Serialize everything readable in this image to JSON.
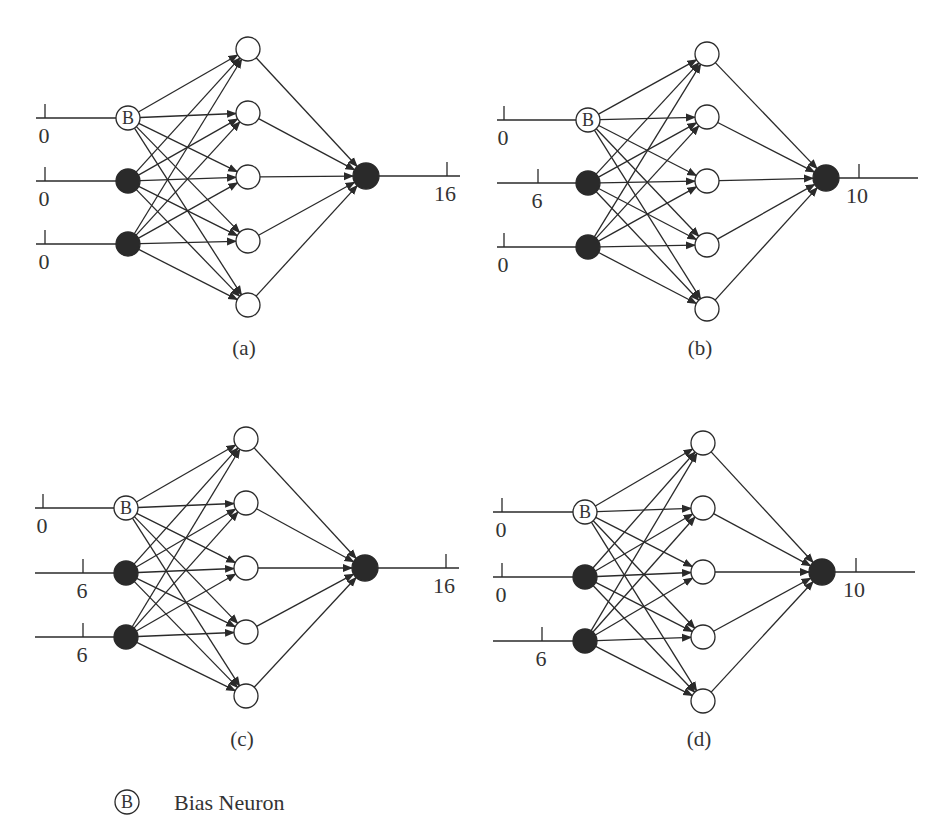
{
  "figure": {
    "colors": {
      "ink": "#2a2a2a",
      "text": "#333333",
      "background": "#ffffff"
    },
    "bias_symbol": "B",
    "legend": {
      "symbol": "B",
      "label": "Bias Neuron",
      "cx": 127,
      "cy": 802,
      "r": 12,
      "text_x": 174,
      "text_y": 810
    },
    "panels": [
      {
        "id": "a",
        "caption": "(a)",
        "caption_x": 244,
        "caption_y": 355,
        "input_line_start": 36,
        "inputs": [
          {
            "type": "bias",
            "value": "0",
            "cx": 128,
            "cy": 118,
            "tick_x": 45
          },
          {
            "type": "neuron",
            "value": "0",
            "cx": 128,
            "cy": 181,
            "tick_x": 45
          },
          {
            "type": "neuron",
            "value": "0",
            "cx": 128,
            "cy": 244,
            "tick_x": 45
          }
        ],
        "hidden": {
          "cx": 248,
          "cy": [
            49,
            113,
            177,
            241,
            305
          ]
        },
        "output": {
          "value": "16",
          "cx": 366,
          "cy": 176,
          "tick_x": 447,
          "line_end": 460
        }
      },
      {
        "id": "b",
        "caption": "(b)",
        "caption_x": 700,
        "caption_y": 355,
        "input_line_start": 497,
        "inputs": [
          {
            "type": "bias",
            "value": "0",
            "cx": 588,
            "cy": 120,
            "tick_x": 504
          },
          {
            "type": "neuron",
            "value": "6",
            "cx": 588,
            "cy": 183,
            "tick_x": 538
          },
          {
            "type": "neuron",
            "value": "0",
            "cx": 588,
            "cy": 247,
            "tick_x": 504
          }
        ],
        "hidden": {
          "cx": 707,
          "cy": [
            54,
            117,
            181,
            245,
            309
          ]
        },
        "output": {
          "value": "10",
          "cx": 826,
          "cy": 178,
          "tick_x": 859,
          "line_end": 918
        }
      },
      {
        "id": "c",
        "caption": "(c)",
        "caption_x": 242,
        "caption_y": 746,
        "input_line_start": 35,
        "inputs": [
          {
            "type": "bias",
            "value": "0",
            "cx": 126,
            "cy": 508,
            "tick_x": 43
          },
          {
            "type": "neuron",
            "value": "6",
            "cx": 126,
            "cy": 573,
            "tick_x": 83
          },
          {
            "type": "neuron",
            "value": "6",
            "cx": 126,
            "cy": 637,
            "tick_x": 83
          }
        ],
        "hidden": {
          "cx": 246,
          "cy": [
            439,
            503,
            568,
            632,
            696
          ]
        },
        "output": {
          "value": "16",
          "cx": 365,
          "cy": 568,
          "tick_x": 446,
          "line_end": 459
        }
      },
      {
        "id": "d",
        "caption": "(d)",
        "caption_x": 699,
        "caption_y": 746,
        "input_line_start": 493,
        "inputs": [
          {
            "type": "bias",
            "value": "0",
            "cx": 585,
            "cy": 512,
            "tick_x": 502
          },
          {
            "type": "neuron",
            "value": "0",
            "cx": 585,
            "cy": 577,
            "tick_x": 502
          },
          {
            "type": "neuron",
            "value": "6",
            "cx": 585,
            "cy": 641,
            "tick_x": 542
          }
        ],
        "hidden": {
          "cx": 703,
          "cy": [
            443,
            508,
            572,
            637,
            701
          ]
        },
        "output": {
          "value": "10",
          "cx": 822,
          "cy": 572,
          "tick_x": 856,
          "line_end": 915
        }
      }
    ]
  }
}
